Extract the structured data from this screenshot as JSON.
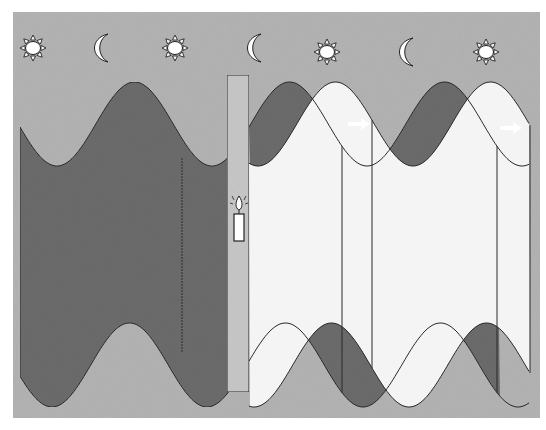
{
  "colors": {
    "background_panel": "#b4b4b4",
    "dark_band": "#6c6c6c",
    "light_band": "#f4f4f4",
    "pulse_bar": "#c8c8c8",
    "line": "#2a2a2a",
    "arrow": "#ffffff",
    "page": "#ffffff"
  },
  "cycle_icons": [
    {
      "type": "sun",
      "name": "sun-icon"
    },
    {
      "type": "moon",
      "name": "moon-icon"
    },
    {
      "type": "sun",
      "name": "sun-icon"
    },
    {
      "type": "moon",
      "name": "moon-icon"
    },
    {
      "type": "sun",
      "name": "sun-icon"
    },
    {
      "type": "moon",
      "name": "moon-icon"
    },
    {
      "type": "sun",
      "name": "sun-icon"
    }
  ],
  "pulse": {
    "label": "Light pulse",
    "icon": "candle-icon"
  },
  "phase_shift_arrows": [
    {
      "name": "phase-shift-arrow",
      "direction": "right"
    },
    {
      "name": "phase-shift-arrow",
      "direction": "right"
    }
  ]
}
